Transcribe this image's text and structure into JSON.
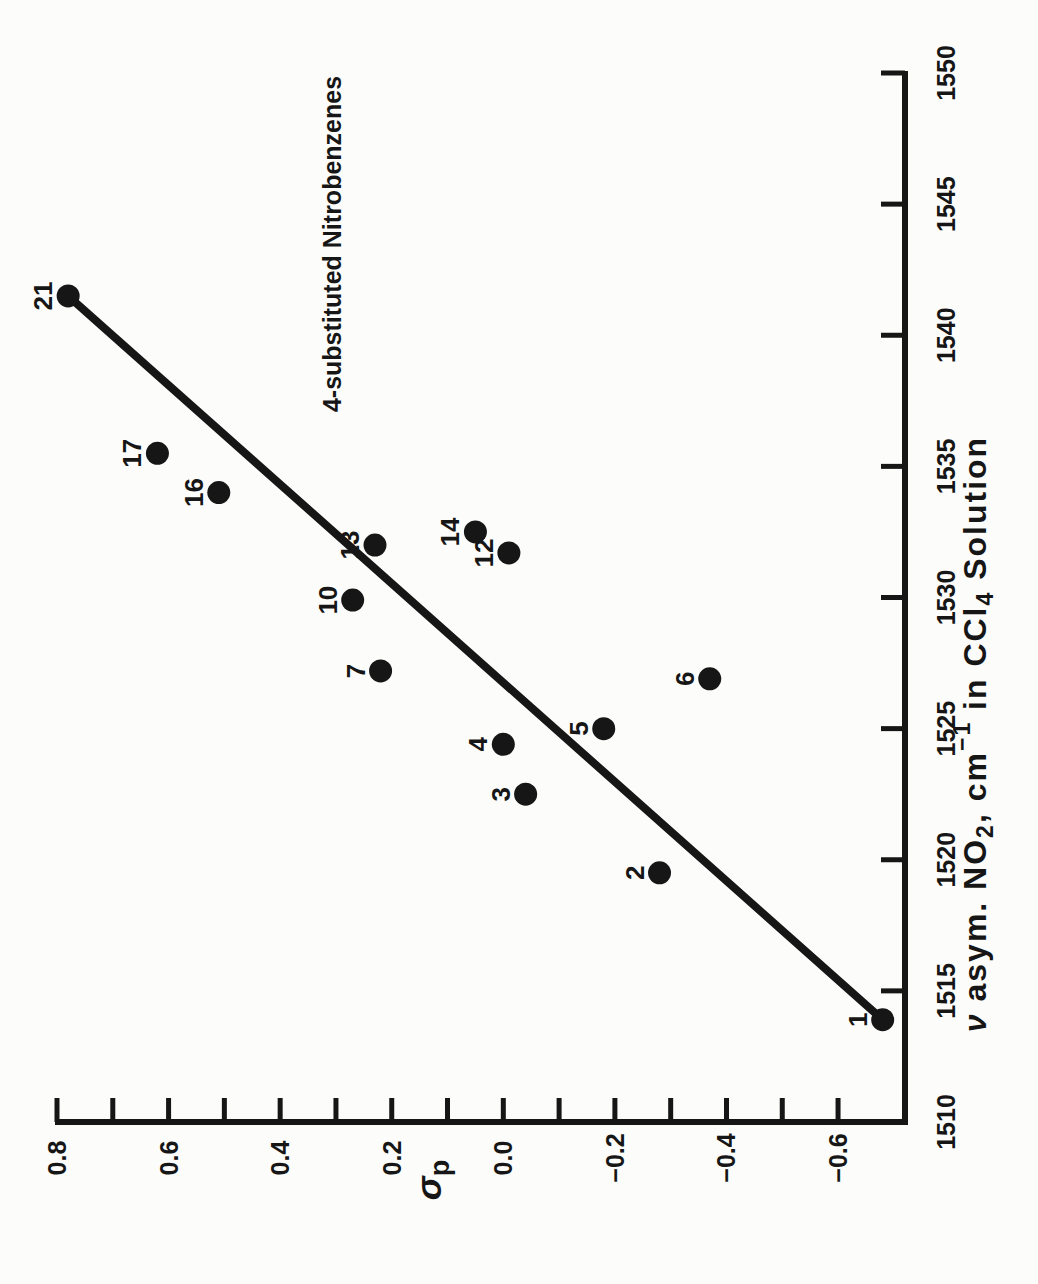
{
  "chart_data": {
    "type": "scatter",
    "orientation": "figure rotated 90 degrees counterclockwise on page",
    "annotation": "4-substituted Nitrobenzenes",
    "xlabel_text": "ν asym. NO₂, cm⁻¹ in CCl₄ Solution",
    "xlabel_parts": [
      {
        "text": "ν",
        "italic": true
      },
      {
        "text": " asym. NO"
      },
      {
        "text": "2",
        "script": "sub"
      },
      {
        "text": ", cm"
      },
      {
        "text": "−1",
        "script": "sup"
      },
      {
        "text": " in CCl"
      },
      {
        "text": "4",
        "script": "sub"
      },
      {
        "text": " Solution"
      }
    ],
    "ylabel_text": "σp",
    "ylabel_parts": [
      {
        "text": "σ",
        "italic": true
      },
      {
        "text": "p",
        "script": "sub"
      }
    ],
    "xlim": [
      1510,
      1550
    ],
    "ylim": [
      -0.72,
      0.8
    ],
    "grid": false,
    "legend": false,
    "x_axis": {
      "tick_step": 5,
      "ticks": [
        1510,
        1515,
        1520,
        1525,
        1530,
        1535,
        1540,
        1545,
        1550
      ],
      "tick_labels": [
        "1510",
        "1515",
        "1520",
        "1525",
        "1530",
        "1535",
        "1540",
        "1545",
        "1550"
      ]
    },
    "y_axis": {
      "tick_step": 0.1,
      "ticks": [
        0.8,
        0.7,
        0.6,
        0.5,
        0.4,
        0.3,
        0.2,
        0.1,
        0.0,
        -0.1,
        -0.2,
        -0.3,
        -0.4,
        -0.5,
        -0.6
      ],
      "labeled": [
        {
          "v": 0.8,
          "label": "0.8"
        },
        {
          "v": 0.6,
          "label": "0.6"
        },
        {
          "v": 0.4,
          "label": "0.4"
        },
        {
          "v": 0.2,
          "label": "0.2"
        },
        {
          "v": 0.0,
          "label": "0.0"
        },
        {
          "v": -0.2,
          "label": "−0.2"
        },
        {
          "v": -0.4,
          "label": "−0.4"
        },
        {
          "v": -0.6,
          "label": "−0.6"
        }
      ]
    },
    "points": [
      {
        "id": "1",
        "x": 1513.9,
        "y": -0.68
      },
      {
        "id": "2",
        "x": 1519.5,
        "y": -0.28
      },
      {
        "id": "3",
        "x": 1522.5,
        "y": -0.04
      },
      {
        "id": "4",
        "x": 1524.4,
        "y": 0.0
      },
      {
        "id": "5",
        "x": 1525.0,
        "y": -0.18
      },
      {
        "id": "6",
        "x": 1526.9,
        "y": -0.37
      },
      {
        "id": "7",
        "x": 1527.2,
        "y": 0.22
      },
      {
        "id": "10",
        "x": 1529.9,
        "y": 0.27
      },
      {
        "id": "12",
        "x": 1531.7,
        "y": -0.01
      },
      {
        "id": "13",
        "x": 1532.0,
        "y": 0.23
      },
      {
        "id": "14",
        "x": 1532.5,
        "y": 0.05
      },
      {
        "id": "16",
        "x": 1534.0,
        "y": 0.51
      },
      {
        "id": "17",
        "x": 1535.5,
        "y": 0.62
      },
      {
        "id": "21",
        "x": 1541.5,
        "y": 0.78
      }
    ],
    "fit_line": {
      "x1": 1513.9,
      "y1": -0.68,
      "x2": 1541.5,
      "y2": 0.78
    },
    "colors": {
      "ink": "#161616",
      "paper": "#fcfcfa"
    }
  }
}
